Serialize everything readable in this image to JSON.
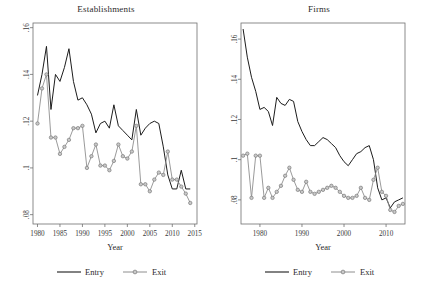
{
  "figure": {
    "panels": [
      "Establishments",
      "Firms"
    ],
    "legend_labels": [
      "Entry",
      "Exit"
    ],
    "xlabel": "Year",
    "colors": {
      "entry": "#1c1c1c",
      "exit": "#8e8e8e",
      "marker_fill": "#c9c9c9",
      "frame": "#6f6f6f"
    }
  },
  "chart_data": [
    {
      "type": "line",
      "title": "Establishments",
      "xlabel": "Year",
      "ylabel": "",
      "xlim": [
        1979,
        2015.5
      ],
      "ylim": [
        0.076,
        0.162
      ],
      "xticks": [
        1980,
        1985,
        1990,
        1995,
        2000,
        2005,
        2010,
        2015
      ],
      "yticks": [
        0.08,
        0.1,
        0.12,
        0.14,
        0.16
      ],
      "ytick_labels": [
        ".08",
        ".1",
        ".12",
        ".14",
        ".16"
      ],
      "xtick_labels": [
        "1980",
        "1985",
        "1990",
        "1995",
        "2000",
        "2005",
        "2010",
        "2015"
      ],
      "grid": false,
      "legend_position": "below",
      "x": [
        1980,
        1981,
        1982,
        1983,
        1984,
        1985,
        1986,
        1987,
        1988,
        1989,
        1990,
        1991,
        1992,
        1993,
        1994,
        1995,
        1996,
        1997,
        1998,
        1999,
        2000,
        2001,
        2002,
        2003,
        2004,
        2005,
        2006,
        2007,
        2008,
        2009,
        2010,
        2011,
        2012,
        2013,
        2014
      ],
      "series": [
        {
          "name": "Entry",
          "marker": false,
          "values": [
            0.131,
            0.14,
            0.152,
            0.125,
            0.14,
            0.137,
            0.143,
            0.151,
            0.137,
            0.129,
            0.13,
            0.127,
            0.123,
            0.115,
            0.119,
            0.12,
            0.117,
            0.127,
            0.118,
            0.116,
            0.114,
            0.112,
            0.125,
            0.114,
            0.117,
            0.119,
            0.12,
            0.119,
            0.109,
            0.097,
            0.091,
            0.091,
            0.099,
            0.091,
            0.091
          ]
        },
        {
          "name": "Exit",
          "marker": true,
          "values": [
            0.119,
            0.134,
            0.14,
            0.113,
            0.113,
            0.106,
            0.109,
            0.112,
            0.117,
            0.117,
            0.118,
            0.1,
            0.105,
            0.11,
            0.101,
            0.101,
            0.099,
            0.103,
            0.11,
            0.105,
            0.104,
            0.107,
            0.118,
            0.093,
            0.093,
            0.09,
            0.095,
            0.098,
            0.097,
            0.107,
            0.095,
            0.095,
            0.092,
            0.089,
            0.085
          ]
        }
      ]
    },
    {
      "type": "line",
      "title": "Firms",
      "xlabel": "Year",
      "ylabel": "",
      "xlim": [
        1975.5,
        2014.5
      ],
      "ylim": [
        0.068,
        0.168
      ],
      "xticks": [
        1980,
        1990,
        2000,
        2010
      ],
      "yticks": [
        0.08,
        0.1,
        0.12,
        0.14,
        0.16
      ],
      "ytick_labels": [
        ".08",
        ".1",
        ".12",
        ".14",
        ".16"
      ],
      "xtick_labels": [
        "1980",
        "1990",
        "2000",
        "2010"
      ],
      "grid": false,
      "legend_position": "below",
      "x": [
        1976,
        1977,
        1978,
        1979,
        1980,
        1981,
        1982,
        1983,
        1984,
        1985,
        1986,
        1987,
        1988,
        1989,
        1990,
        1991,
        1992,
        1993,
        1994,
        1995,
        1996,
        1997,
        1998,
        1999,
        2000,
        2001,
        2002,
        2003,
        2004,
        2005,
        2006,
        2007,
        2008,
        2009,
        2010,
        2011,
        2012,
        2013,
        2014
      ],
      "series": [
        {
          "name": "Entry",
          "marker": false,
          "values": [
            0.165,
            0.151,
            0.141,
            0.134,
            0.125,
            0.126,
            0.124,
            0.117,
            0.131,
            0.128,
            0.127,
            0.13,
            0.129,
            0.119,
            0.114,
            0.11,
            0.107,
            0.107,
            0.109,
            0.111,
            0.11,
            0.108,
            0.106,
            0.102,
            0.099,
            0.097,
            0.1,
            0.103,
            0.104,
            0.106,
            0.107,
            0.1,
            0.086,
            0.08,
            0.081,
            0.076,
            0.079,
            0.08,
            0.081
          ]
        },
        {
          "name": "Exit",
          "marker": true,
          "values": [
            0.102,
            0.103,
            0.081,
            0.102,
            0.102,
            0.081,
            0.086,
            0.081,
            0.084,
            0.087,
            0.092,
            0.096,
            0.09,
            0.085,
            0.084,
            0.089,
            0.084,
            0.083,
            0.084,
            0.085,
            0.086,
            0.087,
            0.086,
            0.084,
            0.082,
            0.081,
            0.081,
            0.082,
            0.086,
            0.081,
            0.08,
            0.09,
            0.096,
            0.084,
            0.082,
            0.075,
            0.074,
            0.077,
            0.078
          ]
        }
      ]
    }
  ]
}
